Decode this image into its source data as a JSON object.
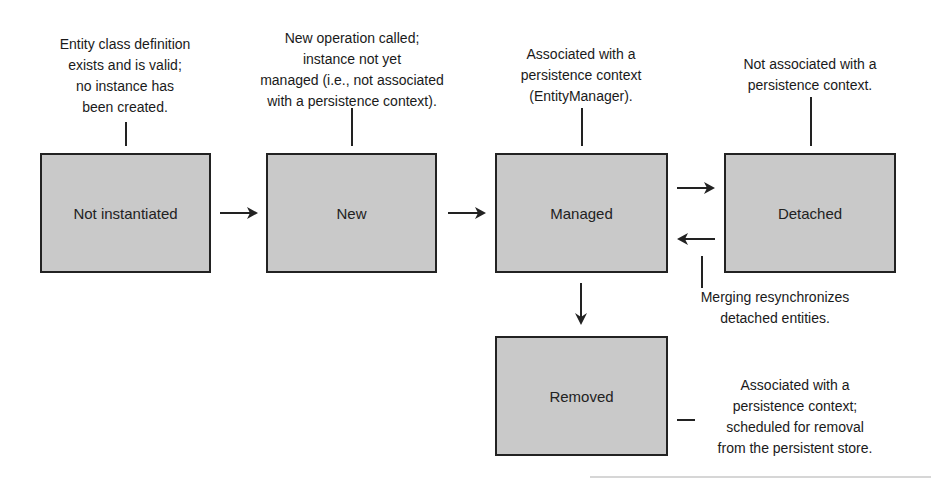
{
  "diagram": {
    "type": "state-diagram",
    "states": [
      {
        "id": "not-instantiated",
        "label": "Not instantiated"
      },
      {
        "id": "new",
        "label": "New"
      },
      {
        "id": "managed",
        "label": "Managed"
      },
      {
        "id": "detached",
        "label": "Detached"
      },
      {
        "id": "removed",
        "label": "Removed"
      }
    ],
    "notes": {
      "not_instantiated": [
        "Entity class definition",
        "exists and is valid;",
        "no instance has",
        "been created."
      ],
      "new": [
        "New operation called;",
        "instance not yet",
        "managed (i.e., not associated",
        "with a persistence context)."
      ],
      "managed": [
        "Associated with a",
        "persistence context",
        "(EntityManager)."
      ],
      "detached": [
        "Not associated with a",
        "persistence context."
      ],
      "merging": [
        "Merging resynchronizes",
        "detached entities."
      ],
      "removed": [
        "Associated with a",
        "persistence context;",
        "scheduled for removal",
        "from the persistent store."
      ]
    },
    "transitions": [
      {
        "from": "not-instantiated",
        "to": "new"
      },
      {
        "from": "new",
        "to": "managed"
      },
      {
        "from": "managed",
        "to": "detached"
      },
      {
        "from": "detached",
        "to": "managed",
        "note": "merging"
      },
      {
        "from": "managed",
        "to": "removed"
      }
    ],
    "colors": {
      "box_fill": "#c9c9c9",
      "box_border": "#222222",
      "text": "#1a1a1a"
    }
  }
}
